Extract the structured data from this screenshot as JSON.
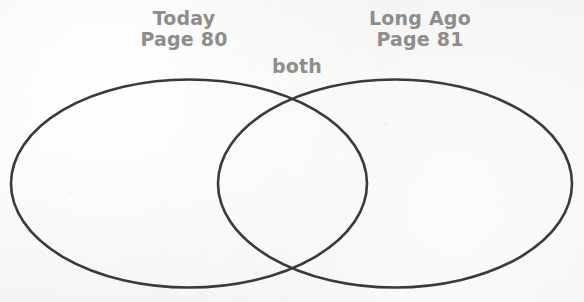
{
  "document": {
    "type": "venn-diagram-worksheet",
    "clipped_header_text": ""
  },
  "colors": {
    "paper": "#f5f5f3",
    "stroke": "#3a3a3a",
    "label_text": "#8d8d8d"
  },
  "diagram": {
    "left_circle": {
      "title": "Today",
      "subtitle": "Page 80"
    },
    "right_circle": {
      "title": "Long Ago",
      "subtitle": "Page 81"
    },
    "overlap": {
      "label": "both"
    }
  }
}
